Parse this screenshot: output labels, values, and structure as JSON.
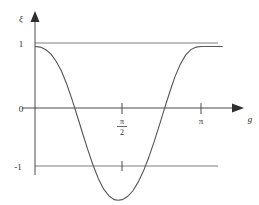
{
  "figure": {
    "name": "function-plot",
    "background_color": "#ffffff",
    "curve_color": "#555555",
    "axis_color": "#4a4a4a",
    "grid_color": "#6e6e6e"
  },
  "axes": {
    "y_label": "ξ",
    "x_label": "g",
    "y_ticks": [
      {
        "label": "1",
        "value": 1
      },
      {
        "label": "0",
        "value": 0
      },
      {
        "label": "-1",
        "value": -1
      }
    ],
    "x_ticks": [
      {
        "label_numerator": "π",
        "label_denominator": "2",
        "label": "π/2",
        "value": 1.5708,
        "is_fraction": true
      },
      {
        "label_numerator": "π",
        "label_denominator": "",
        "label": "π",
        "value": 3.1416,
        "is_fraction": false
      }
    ]
  },
  "chart_data": {
    "type": "line",
    "title": "",
    "xlabel": "g",
    "ylabel": "ξ",
    "xlim": [
      0,
      3.6
    ],
    "ylim": [
      -1.6,
      1.2
    ],
    "grid": true,
    "legend": "none",
    "gridlines_y": [
      1,
      0,
      -1
    ],
    "gridlines_x": [
      1.5708,
      3.1416
    ],
    "series": [
      {
        "name": "xi(g)",
        "x": [
          0.0,
          0.1,
          0.2,
          0.3,
          0.4,
          0.5,
          0.6,
          0.7,
          0.8,
          0.9,
          1.0,
          1.1,
          1.2,
          1.3,
          1.4,
          1.5,
          1.5708,
          1.65,
          1.75,
          1.85,
          1.95,
          2.05,
          2.15,
          2.25,
          2.35,
          2.45,
          2.55,
          2.65,
          2.75,
          2.85,
          2.95,
          3.05,
          3.1416,
          3.25,
          3.35,
          3.45,
          3.55
        ],
        "y": [
          1.0,
          0.99,
          0.95,
          0.88,
          0.76,
          0.6,
          0.39,
          0.14,
          -0.13,
          -0.41,
          -0.68,
          -0.93,
          -1.15,
          -1.32,
          -1.43,
          -1.49,
          -1.5,
          -1.49,
          -1.44,
          -1.35,
          -1.21,
          -1.03,
          -0.81,
          -0.56,
          -0.29,
          -0.01,
          0.26,
          0.51,
          0.71,
          0.86,
          0.95,
          0.99,
          1.0,
          1.0,
          1.0,
          1.0,
          1.0
        ]
      }
    ],
    "annotations": [
      {
        "text": "curve starts at (0, 1) with zero slope"
      },
      {
        "text": "minimum near g = π/2 at ξ ≈ -1.5"
      },
      {
        "text": "returns asymptotically to ξ = 1 near g = π"
      }
    ]
  }
}
